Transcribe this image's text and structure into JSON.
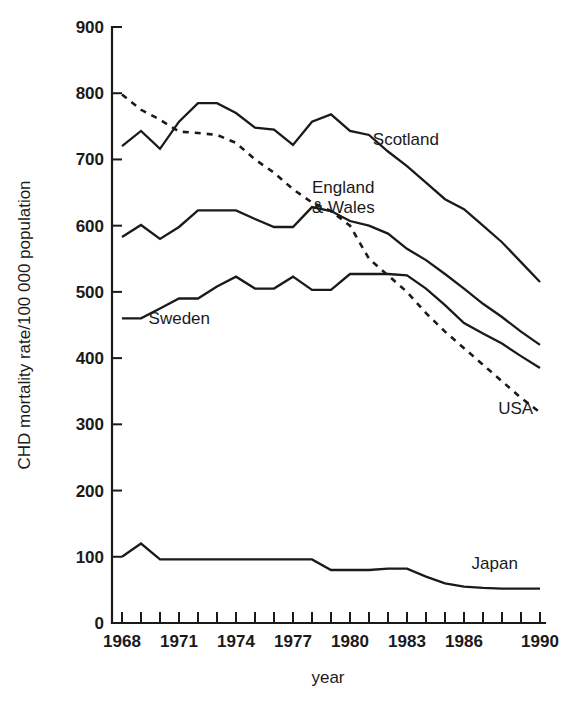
{
  "chart_data": {
    "type": "line",
    "title": "",
    "xlabel": "year",
    "ylabel": "CHD mortality rate/100 000 population",
    "xlim": [
      1968,
      1990
    ],
    "ylim": [
      0,
      900
    ],
    "ytick_step": 100,
    "xtick_step": 1,
    "grid": false,
    "legend_position": "inline-annotations",
    "yticks": [
      0,
      100,
      200,
      300,
      400,
      500,
      600,
      700,
      800,
      900
    ],
    "xticks": [
      1968,
      1969,
      1970,
      1971,
      1972,
      1973,
      1974,
      1975,
      1976,
      1977,
      1978,
      1979,
      1980,
      1981,
      1982,
      1983,
      1984,
      1985,
      1986,
      1987,
      1988,
      1989,
      1990
    ],
    "xtick_labels": [
      "1968",
      "",
      "",
      "1971",
      "",
      "",
      "1974",
      "",
      "",
      "1977",
      "",
      "",
      "1980",
      "",
      "",
      "1983",
      "",
      "",
      "1986",
      "",
      "",
      "",
      "1990"
    ],
    "x": [
      1968,
      1969,
      1970,
      1971,
      1972,
      1973,
      1974,
      1975,
      1976,
      1977,
      1978,
      1979,
      1980,
      1981,
      1982,
      1983,
      1984,
      1985,
      1986,
      1987,
      1988,
      1989,
      1990
    ],
    "series": [
      {
        "name": "Scotland",
        "style": "solid",
        "label": "Scotland",
        "label_x": 1981.2,
        "label_y": 722,
        "values": [
          720,
          743,
          716,
          757,
          785,
          785,
          770,
          748,
          745,
          722,
          757,
          768,
          743,
          737,
          712,
          690,
          665,
          640,
          625,
          600,
          575,
          545,
          515
        ]
      },
      {
        "name": "England & Wales",
        "style": "solid",
        "label": "England\n& Wales",
        "label_x": 1978.0,
        "label_y": 650,
        "values": [
          583,
          601,
          580,
          598,
          623,
          623,
          623,
          610,
          598,
          598,
          628,
          622,
          607,
          600,
          588,
          565,
          548,
          527,
          505,
          482,
          462,
          440,
          420
        ]
      },
      {
        "name": "Sweden",
        "style": "solid",
        "label": "Sweden",
        "label_x": 1969.4,
        "label_y": 452,
        "values": [
          460,
          460,
          475,
          490,
          490,
          508,
          523,
          505,
          505,
          523,
          503,
          503,
          527,
          527,
          527,
          525,
          505,
          480,
          453,
          437,
          422,
          403,
          385
        ]
      },
      {
        "name": "USA",
        "style": "dashed",
        "label": "USA",
        "label_x": 1987.8,
        "label_y": 316,
        "values": [
          798,
          775,
          760,
          742,
          740,
          737,
          725,
          700,
          680,
          655,
          635,
          622,
          600,
          550,
          525,
          500,
          468,
          440,
          415,
          390,
          365,
          340,
          318
        ]
      },
      {
        "name": "Japan",
        "style": "solid",
        "label": "Japan",
        "label_x": 1986.4,
        "label_y": 82,
        "values": [
          100,
          120,
          96,
          96,
          96,
          96,
          96,
          96,
          96,
          96,
          96,
          80,
          80,
          80,
          82,
          82,
          70,
          60,
          55,
          53,
          52,
          52,
          52
        ]
      }
    ]
  },
  "figure": {
    "background_color": "#ffffff",
    "line_color": "#1a1a1a"
  }
}
